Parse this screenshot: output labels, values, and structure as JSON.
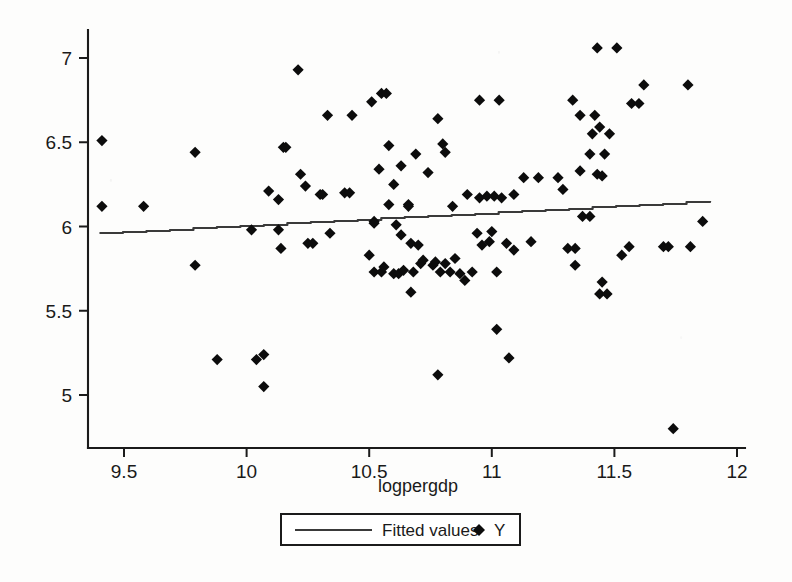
{
  "chart_data": {
    "type": "scatter",
    "title": "",
    "xlabel": "logpergdp",
    "ylabel": "",
    "xlim": [
      9.39,
      12.07
    ],
    "ylim": [
      4.73,
      7.13
    ],
    "xticks": [
      "9.5",
      "10",
      "10.5",
      "11",
      "11.5",
      "12"
    ],
    "xtick_values": [
      9.5,
      10,
      10.5,
      11,
      11.5,
      12
    ],
    "yticks": [
      "5",
      "5.5",
      "6",
      "6.5",
      "7"
    ],
    "ytick_values": [
      5,
      5.5,
      6,
      6.5,
      7
    ],
    "grid": false,
    "legend_position": "below-axis-centered",
    "legend": [
      {
        "label": "Fitted values",
        "marker": "line",
        "color": "#3a3a3a"
      },
      {
        "label": "Y",
        "marker": "diamond",
        "color": "#0c0c0c"
      }
    ],
    "series": [
      {
        "name": "Y",
        "marker": "diamond",
        "color": "#0c0c0c",
        "points": [
          [
            9.41,
            6.51
          ],
          [
            9.41,
            6.12
          ],
          [
            9.58,
            6.12
          ],
          [
            9.79,
            6.44
          ],
          [
            9.79,
            5.77
          ],
          [
            9.88,
            5.21
          ],
          [
            10.02,
            5.98
          ],
          [
            10.04,
            5.21
          ],
          [
            10.07,
            5.05
          ],
          [
            10.07,
            5.24
          ],
          [
            10.09,
            6.21
          ],
          [
            10.13,
            6.16
          ],
          [
            10.13,
            5.98
          ],
          [
            10.15,
            6.47
          ],
          [
            10.16,
            6.47
          ],
          [
            10.14,
            5.87
          ],
          [
            10.21,
            6.93
          ],
          [
            10.22,
            6.31
          ],
          [
            10.24,
            6.24
          ],
          [
            10.25,
            5.9
          ],
          [
            10.27,
            5.9
          ],
          [
            10.3,
            6.19
          ],
          [
            10.31,
            6.19
          ],
          [
            10.33,
            6.66
          ],
          [
            10.34,
            5.96
          ],
          [
            10.4,
            6.2
          ],
          [
            10.42,
            6.2
          ],
          [
            10.43,
            6.66
          ],
          [
            10.5,
            5.83
          ],
          [
            10.51,
            6.74
          ],
          [
            10.52,
            6.03
          ],
          [
            10.52,
            6.02
          ],
          [
            10.52,
            5.73
          ],
          [
            10.54,
            6.34
          ],
          [
            10.55,
            6.79
          ],
          [
            10.57,
            6.79
          ],
          [
            10.55,
            5.73
          ],
          [
            10.56,
            5.76
          ],
          [
            10.58,
            6.48
          ],
          [
            10.58,
            6.13
          ],
          [
            10.6,
            6.25
          ],
          [
            10.6,
            5.72
          ],
          [
            10.61,
            6.01
          ],
          [
            10.62,
            5.72
          ],
          [
            10.63,
            6.36
          ],
          [
            10.63,
            5.95
          ],
          [
            10.64,
            5.74
          ],
          [
            10.66,
            6.13
          ],
          [
            10.66,
            6.12
          ],
          [
            10.67,
            5.9
          ],
          [
            10.67,
            5.61
          ],
          [
            10.68,
            5.73
          ],
          [
            10.69,
            6.43
          ],
          [
            10.7,
            5.89
          ],
          [
            10.71,
            5.78
          ],
          [
            10.72,
            5.8
          ],
          [
            10.74,
            6.32
          ],
          [
            10.76,
            5.77
          ],
          [
            10.77,
            5.79
          ],
          [
            10.78,
            6.64
          ],
          [
            10.78,
            5.12
          ],
          [
            10.79,
            5.73
          ],
          [
            10.8,
            6.49
          ],
          [
            10.81,
            6.44
          ],
          [
            10.81,
            5.78
          ],
          [
            10.83,
            5.73
          ],
          [
            10.84,
            6.12
          ],
          [
            10.85,
            5.81
          ],
          [
            10.87,
            5.72
          ],
          [
            10.89,
            5.68
          ],
          [
            10.9,
            6.19
          ],
          [
            10.92,
            5.73
          ],
          [
            10.94,
            5.96
          ],
          [
            10.95,
            6.75
          ],
          [
            10.95,
            6.17
          ],
          [
            10.96,
            5.89
          ],
          [
            10.98,
            6.18
          ],
          [
            10.99,
            5.91
          ],
          [
            11.0,
            5.97
          ],
          [
            11.01,
            6.18
          ],
          [
            11.02,
            5.39
          ],
          [
            11.02,
            5.73
          ],
          [
            11.03,
            6.75
          ],
          [
            11.04,
            6.17
          ],
          [
            11.06,
            5.9
          ],
          [
            11.07,
            5.22
          ],
          [
            11.09,
            6.19
          ],
          [
            11.09,
            5.86
          ],
          [
            11.13,
            6.29
          ],
          [
            11.16,
            5.91
          ],
          [
            11.19,
            6.29
          ],
          [
            11.27,
            6.29
          ],
          [
            11.29,
            6.22
          ],
          [
            11.31,
            5.87
          ],
          [
            11.33,
            6.75
          ],
          [
            11.34,
            5.77
          ],
          [
            11.34,
            5.87
          ],
          [
            11.36,
            6.66
          ],
          [
            11.36,
            6.33
          ],
          [
            11.37,
            6.06
          ],
          [
            11.4,
            6.06
          ],
          [
            11.4,
            6.43
          ],
          [
            11.41,
            6.55
          ],
          [
            11.42,
            6.66
          ],
          [
            11.43,
            7.06
          ],
          [
            11.43,
            6.31
          ],
          [
            11.44,
            6.59
          ],
          [
            11.44,
            5.6
          ],
          [
            11.45,
            6.3
          ],
          [
            11.45,
            5.67
          ],
          [
            11.46,
            6.43
          ],
          [
            11.47,
            5.6
          ],
          [
            11.48,
            6.55
          ],
          [
            11.51,
            7.06
          ],
          [
            11.53,
            5.83
          ],
          [
            11.56,
            5.88
          ],
          [
            11.57,
            6.73
          ],
          [
            11.6,
            6.73
          ],
          [
            11.62,
            6.84
          ],
          [
            11.7,
            5.88
          ],
          [
            11.72,
            5.88
          ],
          [
            11.74,
            4.8
          ],
          [
            11.8,
            6.84
          ],
          [
            11.81,
            5.88
          ],
          [
            11.86,
            6.03
          ]
        ]
      }
    ],
    "fit_line": {
      "name": "Fitted values",
      "color": "#3a3a3a",
      "x_start": 9.4,
      "x_end": 11.89,
      "y_start": 5.96,
      "y_end": 6.15
    }
  },
  "axes": {
    "x_axis_label": "logpergdp"
  }
}
